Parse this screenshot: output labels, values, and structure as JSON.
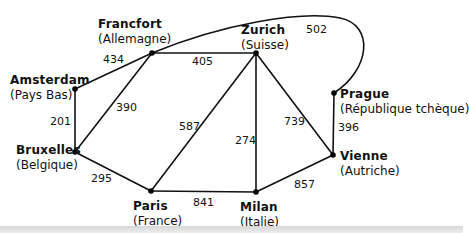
{
  "nodes": [
    {
      "id": "francfort",
      "city": "Francfort",
      "country": "(Allemagne)",
      "x": 152,
      "y": 53
    },
    {
      "id": "zurich",
      "city": "Zurich",
      "country": "(Suisse)",
      "x": 256,
      "y": 53
    },
    {
      "id": "amsterdam",
      "city": "Amsterdam",
      "country": "(Pays Bas)",
      "x": 75,
      "y": 89
    },
    {
      "id": "bruxelles",
      "city": "Bruxelles",
      "country": "(Belgique)",
      "x": 75,
      "y": 152
    },
    {
      "id": "paris",
      "city": "Paris",
      "country": "(France)",
      "x": 151,
      "y": 191
    },
    {
      "id": "milan",
      "city": "Milan",
      "country": "(Italie)",
      "x": 256,
      "y": 192
    },
    {
      "id": "prague",
      "city": "Prague",
      "country": "(République tchèque)",
      "x": 334,
      "y": 93
    },
    {
      "id": "vienne",
      "city": "Vienne",
      "country": "(Autriche)",
      "x": 333,
      "y": 155
    }
  ],
  "edges": [
    {
      "from": "amsterdam",
      "to": "francfort",
      "distance": "434"
    },
    {
      "from": "francfort",
      "to": "zurich",
      "distance": "405"
    },
    {
      "from": "francfort",
      "to": "prague",
      "distance": "502"
    },
    {
      "from": "amsterdam",
      "to": "bruxelles",
      "distance": "201"
    },
    {
      "from": "francfort",
      "to": "bruxelles",
      "distance": "390"
    },
    {
      "from": "bruxelles",
      "to": "paris",
      "distance": "295"
    },
    {
      "from": "zurich",
      "to": "paris",
      "distance": "587"
    },
    {
      "from": "zurich",
      "to": "milan",
      "distance": "274"
    },
    {
      "from": "zurich",
      "to": "vienne",
      "distance": "739"
    },
    {
      "from": "prague",
      "to": "vienne",
      "distance": "396"
    },
    {
      "from": "paris",
      "to": "milan",
      "distance": "841"
    },
    {
      "from": "milan",
      "to": "vienne",
      "distance": "857"
    }
  ]
}
